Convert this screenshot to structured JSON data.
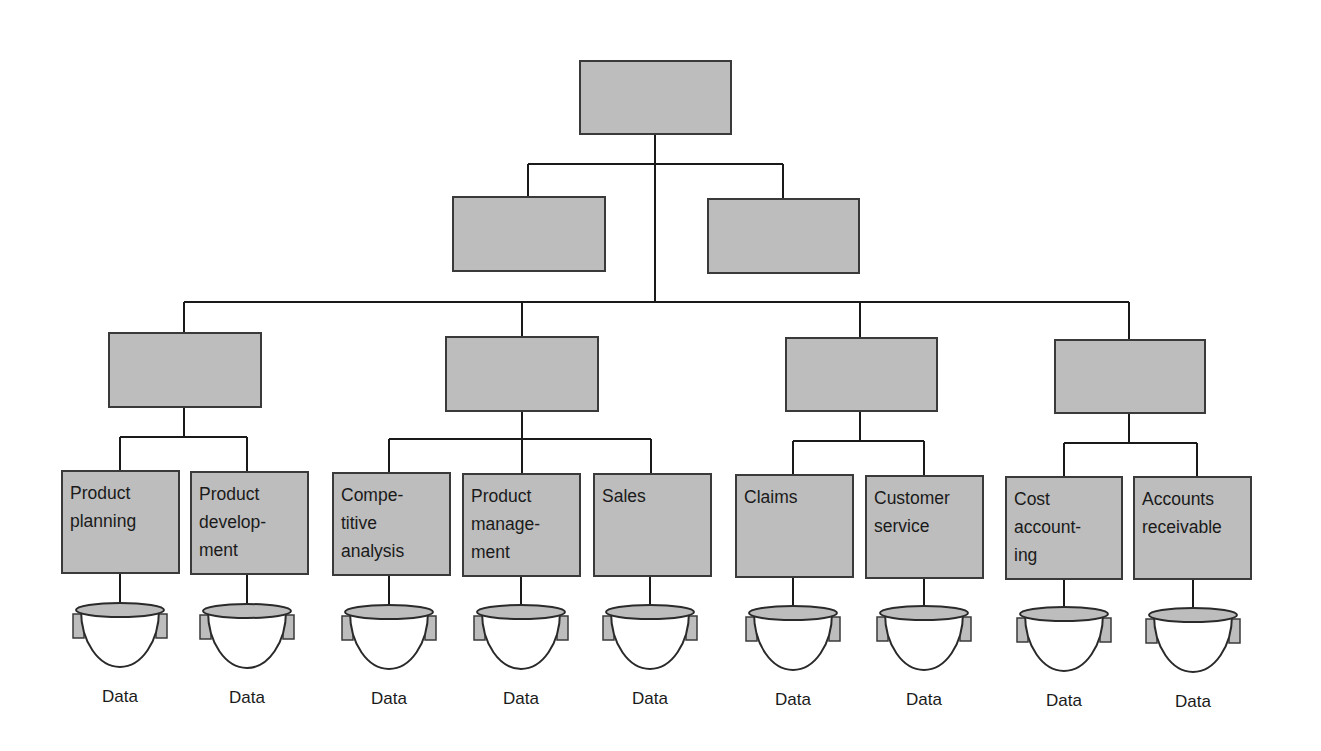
{
  "diagram": {
    "type": "hierarchy-org-chart",
    "root": {
      "label": ""
    },
    "level2": [
      {
        "label": ""
      },
      {
        "label": ""
      }
    ],
    "level3": [
      {
        "label": ""
      },
      {
        "label": ""
      },
      {
        "label": ""
      },
      {
        "label": ""
      }
    ],
    "leaves": [
      {
        "label": "Product\nplanning",
        "group": 0,
        "data_label": "Data"
      },
      {
        "label": "Product\ndevelop-\nment",
        "group": 0,
        "data_label": "Data"
      },
      {
        "label": "Compe-\ntitive\nanalysis",
        "group": 1,
        "data_label": "Data"
      },
      {
        "label": "Product\nmanage-\nment",
        "group": 1,
        "data_label": "Data"
      },
      {
        "label": "Sales",
        "group": 1,
        "data_label": "Data"
      },
      {
        "label": "Claims",
        "group": 2,
        "data_label": "Data"
      },
      {
        "label": "Customer\nservice",
        "group": 2,
        "data_label": "Data"
      },
      {
        "label": "Cost\naccount-\ning",
        "group": 3,
        "data_label": "Data"
      },
      {
        "label": "Accounts\nreceivable",
        "group": 3,
        "data_label": "Data"
      }
    ],
    "data_store_icon": "database-bowl-icon",
    "colors": {
      "box_fill": "#bdbdbd",
      "box_border": "#3a3a3a",
      "line": "#1a1a1a",
      "background": "#ffffff"
    }
  }
}
